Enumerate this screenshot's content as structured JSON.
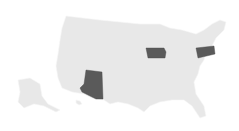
{
  "map": {
    "region": "United States",
    "base_color": "#e8e8e8",
    "highlight_color": "#5a5a5a",
    "highlighted_states": [
      {
        "name": "Arizona"
      },
      {
        "name": "Iowa"
      },
      {
        "name": "Pennsylvania"
      }
    ]
  }
}
